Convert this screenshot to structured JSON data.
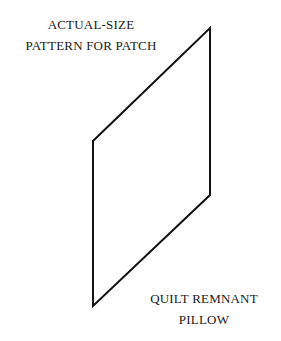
{
  "title_lines": [
    "ACTUAL-SIZE",
    "PATTERN FOR PATCH"
  ],
  "caption_lines": [
    "QUILT REMNANT",
    "PILLOW"
  ],
  "shape": {
    "kind": "parallelogram",
    "stroke_color": "#111111",
    "fill_color": "#ffffff"
  }
}
